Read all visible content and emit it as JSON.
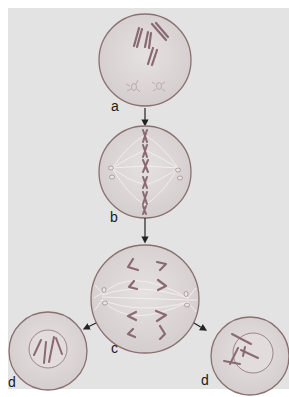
{
  "diagram": {
    "type": "cell-division-stages",
    "colors": {
      "background": "#e3e3e3",
      "cell_fill": "#dcd6d6",
      "cell_outline": "#8a7070",
      "chromosome": "#8a6a72",
      "spindle": "#f4f0f0",
      "arrow": "#222222"
    },
    "stages": [
      {
        "id": "a",
        "label": "a",
        "description": "prophase-like cell with scattered chromosomes and two centrosomes"
      },
      {
        "id": "b",
        "label": "b",
        "description": "metaphase-like cell with chromosomes aligned at equator and spindle fibers"
      },
      {
        "id": "c",
        "label": "c",
        "description": "anaphase-like cell with chromosomes separating toward poles"
      },
      {
        "id": "d-left",
        "label": "d",
        "description": "daughter cell with nucleus containing chromosomes"
      },
      {
        "id": "d-right",
        "label": "d",
        "description": "daughter cell with nucleus containing chromosomes"
      }
    ],
    "arrows": [
      {
        "from": "a",
        "to": "b"
      },
      {
        "from": "b",
        "to": "c"
      },
      {
        "from": "c",
        "to": "d-left"
      },
      {
        "from": "c",
        "to": "d-right"
      }
    ]
  }
}
